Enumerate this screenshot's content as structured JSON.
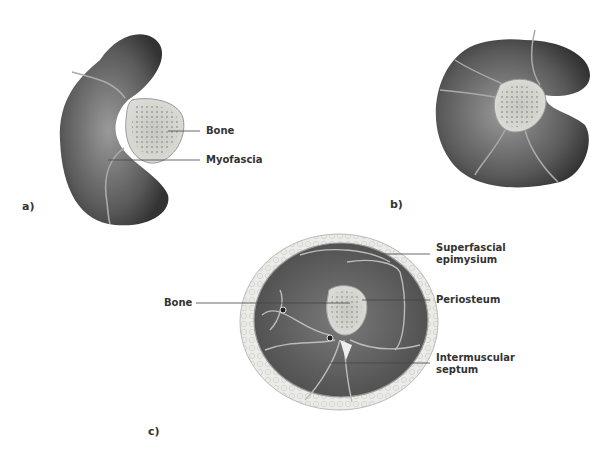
{
  "panels": {
    "a": {
      "letter": "a)",
      "labels": {
        "bone": "Bone",
        "myofascia": "Myofascia"
      }
    },
    "b": {
      "letter": "b)"
    },
    "c": {
      "letter": "c)",
      "labels": {
        "bone": "Bone",
        "superfascial_1": "Superfascial",
        "superfascial_2": "epimysium",
        "periosteum": "Periosteum",
        "septum_1": "Intermuscular",
        "septum_2": "septum"
      }
    }
  },
  "colors": {
    "muscle_dark": "#3a3a3a",
    "muscle_light": "#8a8a8a",
    "bone_fill": "#d6d6d0",
    "fat_fill": "#e8e8e4",
    "leader_line": "#444444"
  }
}
